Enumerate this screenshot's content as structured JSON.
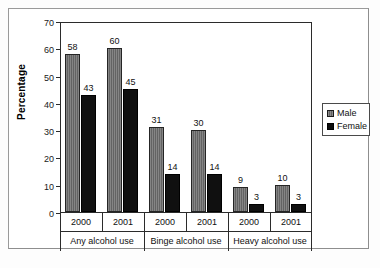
{
  "chart_data": {
    "type": "bar",
    "title": "",
    "xlabel": "",
    "ylabel": "Percentage",
    "ylim": [
      0,
      70
    ],
    "ytick_step": 10,
    "yticks": [
      70,
      60,
      50,
      40,
      30,
      20,
      10,
      0
    ],
    "grid": false,
    "legend_position": "right",
    "categories": [
      "2000",
      "2001",
      "2000",
      "2001",
      "2000",
      "2001"
    ],
    "group_labels": [
      "Any alcohol use",
      "Binge alcohol use",
      "Heavy alcohol use"
    ],
    "group_span": 2,
    "series": [
      {
        "name": "Male",
        "color": "#6e6e6e",
        "values": [
          58,
          60,
          31,
          30,
          9,
          10
        ]
      },
      {
        "name": "Female",
        "color": "#101010",
        "values": [
          43,
          45,
          14,
          14,
          3,
          3
        ]
      }
    ],
    "data_labels": [
      "58",
      "43",
      "60",
      "45",
      "31",
      "14",
      "30",
      "14",
      "9",
      "3",
      "10",
      "3"
    ]
  },
  "axis": {
    "y_title": "Percentage",
    "y_ticks": [
      "70",
      "60",
      "50",
      "40",
      "30",
      "20",
      "10",
      "0"
    ]
  },
  "legend": {
    "items": [
      {
        "label": "Male"
      },
      {
        "label": "Female"
      }
    ]
  },
  "x_axis": {
    "years": [
      "2000",
      "2001",
      "2000",
      "2001",
      "2000",
      "2001"
    ],
    "groups": [
      "Any alcohol use",
      "Binge alcohol use",
      "Heavy alcohol use"
    ]
  }
}
